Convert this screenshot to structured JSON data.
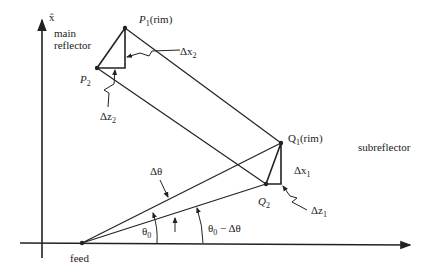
{
  "axes": {
    "vertical_label": "x̂",
    "horizontal_label": ""
  },
  "labels": {
    "main_reflector": [
      "main",
      "reflector"
    ],
    "subreflector": "subreflector",
    "feed": "feed",
    "P1": "P",
    "P1_sub": "1",
    "P1_suffix": "(rim)",
    "P2": "P",
    "P2_sub": "2",
    "Q1": "Q",
    "Q1_sub": "1",
    "Q1_suffix": "(rim)",
    "Q2": "Q",
    "Q2_sub": "2",
    "dx2": "Δx",
    "dx2_sub": "2",
    "dz2": "Δz",
    "dz2_sub": "2",
    "dx1": "Δx",
    "dx1_sub": "1",
    "dz1": "Δz",
    "dz1_sub": "1",
    "dtheta": "Δθ",
    "theta0": "θ",
    "theta0_sub": "0",
    "theta0_minus": "θ",
    "theta0_minus_sub": "0",
    "theta0_minus_rest": " − Δθ"
  },
  "points": {
    "feed": [
      82,
      243
    ],
    "P1": [
      125,
      28
    ],
    "P2": [
      97,
      68
    ],
    "Q1": [
      281,
      143
    ],
    "Q2": [
      266,
      184
    ]
  },
  "colors": {
    "ink": "#222222"
  }
}
